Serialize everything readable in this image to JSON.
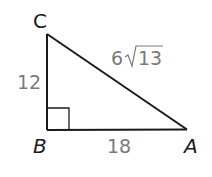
{
  "diagram": {
    "type": "right-triangle",
    "vertices": {
      "C": {
        "label": "C",
        "x": 47,
        "y": 34
      },
      "B": {
        "label": "B",
        "x": 47,
        "y": 130
      },
      "A": {
        "label": "A",
        "x": 187,
        "y": 129
      }
    },
    "right_angle_at": "B",
    "sides": {
      "CB": {
        "label": "12"
      },
      "BA": {
        "label": "18"
      },
      "CA": {
        "label_coefficient": "6",
        "label_radicand": "13"
      }
    },
    "colors": {
      "stroke": "#1a1a1a",
      "side_label": "#7a7a7a",
      "vertex_label": "#1a1a1a"
    }
  }
}
